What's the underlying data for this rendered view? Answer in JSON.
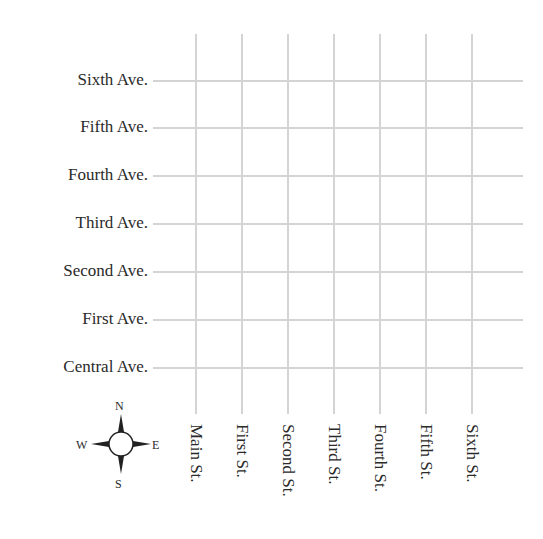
{
  "map": {
    "avenues": [
      {
        "label": "Sixth Ave.",
        "y": 81
      },
      {
        "label": "Fifth Ave.",
        "y": 128
      },
      {
        "label": "Fourth Ave.",
        "y": 176
      },
      {
        "label": "Third Ave.",
        "y": 224
      },
      {
        "label": "Second Ave.",
        "y": 272
      },
      {
        "label": "First Ave.",
        "y": 320
      },
      {
        "label": "Central Ave.",
        "y": 368
      }
    ],
    "streets": [
      {
        "label": "Main St.",
        "x": 196
      },
      {
        "label": "First St.",
        "x": 242
      },
      {
        "label": "Second St.",
        "x": 288
      },
      {
        "label": "Third St.",
        "x": 334
      },
      {
        "label": "Fourth St.",
        "x": 380
      },
      {
        "label": "Fifth St.",
        "x": 426
      },
      {
        "label": "Sixth St.",
        "x": 472
      }
    ],
    "compass": {
      "north": "N",
      "south": "S",
      "east": "E",
      "west": "W"
    },
    "colors": {
      "grid_line": "#d4d4d4",
      "text": "#2a2a2a"
    }
  }
}
